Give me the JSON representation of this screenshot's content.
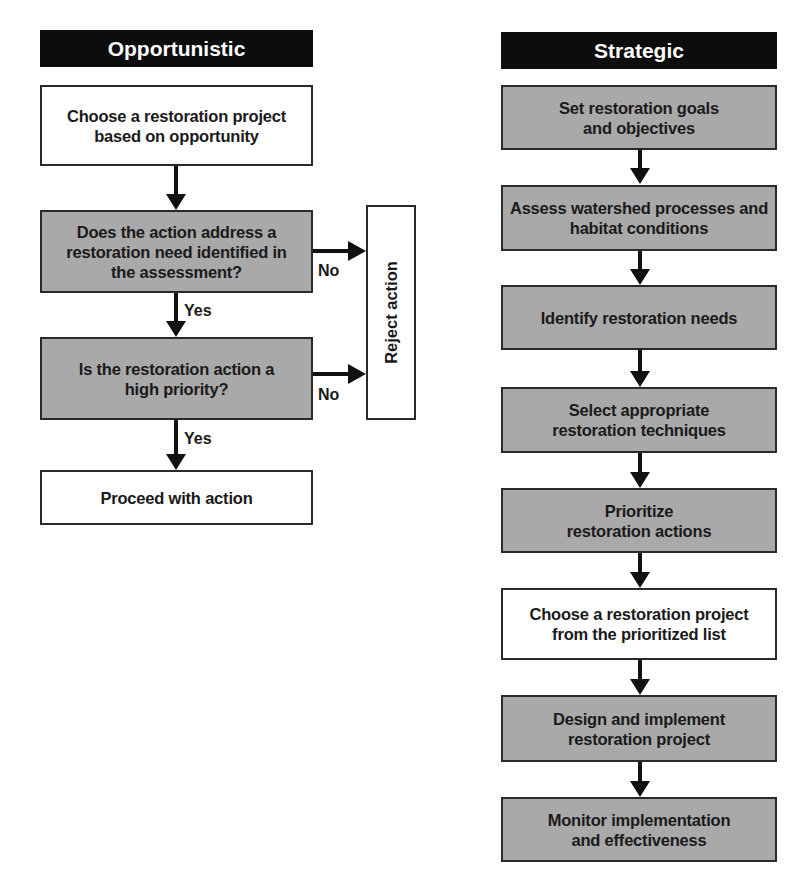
{
  "opportunistic": {
    "title": "Opportunistic",
    "steps": [
      {
        "text": "Choose a restoration project based on opportunity",
        "style": "white"
      },
      {
        "text": "Does the action address a restoration need identified in the assessment?",
        "style": "gray"
      },
      {
        "text": "Is the restoration action a high priority?",
        "style": "gray"
      },
      {
        "text": "Proceed with action",
        "style": "white"
      }
    ],
    "edge_labels": {
      "yes1": "Yes",
      "yes2": "Yes",
      "no1": "No",
      "no2": "No"
    },
    "reject": "Reject action"
  },
  "strategic": {
    "title": "Strategic",
    "steps": [
      {
        "text": "Set restoration goals and objectives",
        "style": "gray"
      },
      {
        "text": "Assess watershed processes and habitat conditions",
        "style": "gray"
      },
      {
        "text": "Identify restoration needs",
        "style": "gray"
      },
      {
        "text": "Select appropriate restoration techniques",
        "style": "gray"
      },
      {
        "text": "Prioritize restoration actions",
        "style": "gray"
      },
      {
        "text": "Choose a restoration project from the prioritized list",
        "style": "white"
      },
      {
        "text": "Design and implement restoration project",
        "style": "gray"
      },
      {
        "text": "Monitor implementation and effectiveness",
        "style": "gray"
      }
    ]
  },
  "colors": {
    "header_bg": "#0d0d0d",
    "gray_box": "#a9a9a9",
    "white_box": "#ffffff",
    "line": "#111111"
  }
}
